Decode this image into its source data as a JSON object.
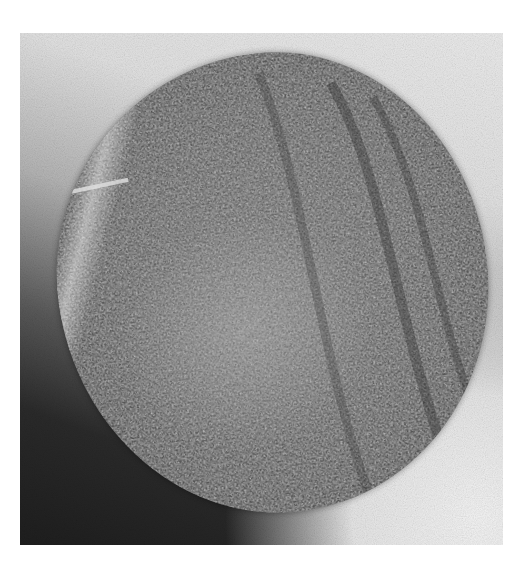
{
  "image": {
    "description": "Grayscale photograph of a roughly circular granular stone specimen (fractured cross-section) on a gradient background",
    "subject": "circular rock specimen",
    "colors": {
      "background_light": "#ececec",
      "background_dark": "#1e1e1e",
      "specimen_mid": "#5c5c5c",
      "page_background": "#ffffff"
    }
  }
}
